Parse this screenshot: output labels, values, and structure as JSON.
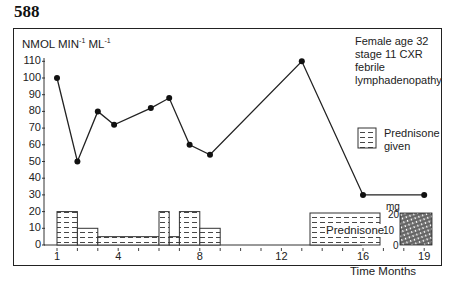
{
  "page_number": "588",
  "chart_data": {
    "type": "line",
    "title": "",
    "ylabel": "NMOL MIN-1 ML-1",
    "ylabel_parts": {
      "main1": "NMOL MIN",
      "sup1": "-1",
      "main2": " ML",
      "sup2": "-1"
    },
    "xlabel": "Time Months",
    "ylim": [
      0,
      110
    ],
    "y_ticks": [
      0,
      10,
      20,
      30,
      40,
      50,
      60,
      70,
      80,
      90,
      100,
      110
    ],
    "x_tick_labels": [
      "1",
      "4",
      "8",
      "12",
      "16",
      "19"
    ],
    "grid": false,
    "series": [
      {
        "name": "Enzyme activity",
        "x": [
          1,
          2,
          3,
          3.8,
          5.6,
          6.5,
          7.5,
          8.5,
          13,
          16,
          19
        ],
        "values": [
          100,
          50,
          80,
          72,
          82,
          88,
          60,
          54,
          110,
          30,
          30
        ]
      }
    ],
    "prednisone_bars": {
      "unit": "mg",
      "segments": [
        {
          "from": 1,
          "to": 2,
          "dose": 20
        },
        {
          "from": 2,
          "to": 3,
          "dose": 10
        },
        {
          "from": 3,
          "to": 6,
          "dose": 5
        },
        {
          "from": 6,
          "to": 6.5,
          "dose": 20
        },
        {
          "from": 6.5,
          "to": 7,
          "dose": 5
        },
        {
          "from": 7,
          "to": 8,
          "dose": 20
        },
        {
          "from": 8,
          "to": 9,
          "dose": 10
        }
      ],
      "legend_scale_ticks": [
        "20",
        "10",
        "0"
      ]
    },
    "annotations": {
      "patient": [
        "Female age 32",
        "stage 11 CXR",
        "febrile",
        "lymphadenopathy"
      ],
      "legend": [
        "Prednisone",
        "given"
      ],
      "prednisone_block_label": "Prednisone",
      "mg_label": "mg"
    }
  }
}
